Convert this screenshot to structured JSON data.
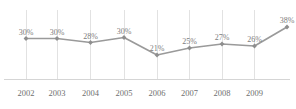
{
  "chart_data": {
    "type": "line",
    "title": "",
    "subtitle": "",
    "xlabel": "",
    "ylabel": "",
    "categories": [
      "2002",
      "2003",
      "2004",
      "2005",
      "2006",
      "2007",
      "2008",
      "2009",
      ""
    ],
    "tick_labels": [
      "2002",
      "2003",
      "2004",
      "2005",
      "2006",
      "2007",
      "2008",
      "2009"
    ],
    "values": [
      30,
      30,
      28,
      30,
      21,
      25,
      27,
      26,
      38
    ],
    "data_labels": [
      "30%",
      "30%",
      "28%",
      "30%",
      "21%",
      "25%",
      "27%",
      "26%",
      "38%"
    ],
    "series": [
      {
        "name": "",
        "values": [
          30,
          30,
          28,
          30,
          21,
          25,
          27,
          26,
          38
        ]
      }
    ],
    "ylim": [
      0,
      40
    ],
    "xlim": [
      0,
      8
    ],
    "grid": "vertical-only",
    "legend": "none",
    "axis": "x-axis-line-only",
    "unit": "%"
  },
  "style": {
    "line_color": "#9a9a9a",
    "marker_color": "#8e8e8e",
    "gridline_color": "#e2e2e2",
    "axis_color": "#d5d5d5",
    "label_color": "#7d7d7d",
    "tick_color": "#6f6f6f",
    "background": "#ffffff"
  },
  "geometry": {
    "point_x": [
      26,
      57,
      90.5,
      124,
      157,
      189.5,
      222,
      254.5,
      287
    ],
    "point_y": [
      38.5,
      38.5,
      42.5,
      37.5,
      55,
      48,
      44,
      46,
      27
    ],
    "gridline_x": [
      26,
      57,
      90.5,
      124,
      157,
      189.5,
      222,
      254.5
    ],
    "grid_top": 10,
    "grid_bottom": 79,
    "axis_y": 79.5,
    "axis_x_start": 4,
    "axis_x_end": 290,
    "label_offset_y": -11,
    "tick_y": 88
  }
}
